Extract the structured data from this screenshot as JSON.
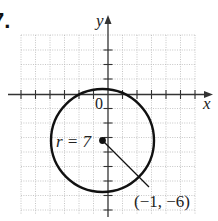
{
  "problem": {
    "number_label": "7."
  },
  "axes": {
    "x_label": "x",
    "y_label": "y",
    "origin_label": "0"
  },
  "circle": {
    "radius_label": "r = 7",
    "center_label": "(−1, −6)",
    "center": [
      -1,
      -6
    ],
    "radius": 7
  },
  "colors": {
    "curve": "#111111",
    "axis": "#333333",
    "grid": "#b8b8b8"
  }
}
